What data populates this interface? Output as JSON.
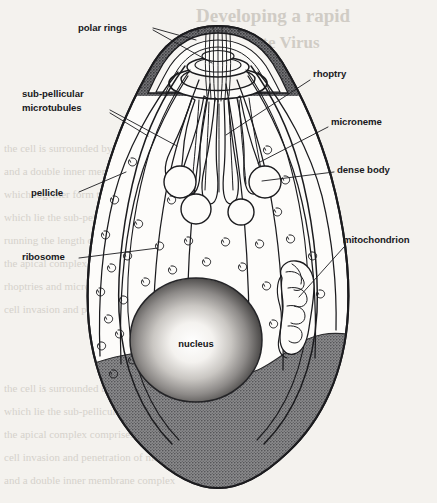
{
  "page": {
    "background_color": "#f4f2ee",
    "ink_color": "#1b1b1e",
    "width": 437,
    "height": 503
  },
  "figure": {
    "organism_shape": "pear-shaped / teardrop cell with apical complex at top",
    "fill_colors": {
      "cytoplasm": "#fdfcfa",
      "apical_cap_shading": "#6e6e70",
      "posterior_shading": "#7e7e80",
      "nucleus_rim": "#2a2a2c",
      "nucleus_core": "#fbfaf8"
    }
  },
  "labels": [
    {
      "id": "polar-rings",
      "text": "polar rings",
      "x": 78,
      "y": 31,
      "anchor": "start"
    },
    {
      "id": "sub-pellicular",
      "text": "sub-pellicular",
      "x": 22,
      "y": 97,
      "anchor": "start"
    },
    {
      "id": "microtubules",
      "text": "microtubules",
      "x": 22,
      "y": 111,
      "anchor": "start"
    },
    {
      "id": "pellicle",
      "text": "pellicle",
      "x": 31,
      "y": 196,
      "anchor": "start"
    },
    {
      "id": "ribosome",
      "text": "ribosome",
      "x": 22,
      "y": 260,
      "anchor": "start"
    },
    {
      "id": "rhoptry",
      "text": "rhoptry",
      "x": 313,
      "y": 77,
      "anchor": "start"
    },
    {
      "id": "microneme",
      "text": "microneme",
      "x": 331,
      "y": 125,
      "anchor": "start"
    },
    {
      "id": "dense-body",
      "text": "dense body",
      "x": 337,
      "y": 173,
      "anchor": "start"
    },
    {
      "id": "mitochondrion",
      "text": "mitochondrion",
      "x": 343,
      "y": 243,
      "anchor": "start"
    },
    {
      "id": "nucleus",
      "text": "nucleus",
      "x": 196,
      "y": 347,
      "anchor": "middle"
    }
  ],
  "bleed_through": {
    "note": "faint mirrored text showing through from the reverse page",
    "title_line_1": "Developing a rapid",
    "title_line_2": "Candidate Virus",
    "body_lines": [
      "the cell is surrounded by a plasma membrane",
      "and a double inner membrane complex",
      "which together form the pellicle, beneath",
      "which lie the sub-pellicular microtubules",
      "running the length of the organism",
      "the apical complex comprises polar rings",
      "rhoptries and micronemes involved in host",
      "cell invasion and penetration of membranes"
    ]
  },
  "organelles": [
    {
      "name": "polar rings",
      "count": 2,
      "location": "apical tip"
    },
    {
      "name": "conoid/apical cap",
      "count": 1,
      "location": "apical tip"
    },
    {
      "name": "rhoptry",
      "count": 5,
      "location": "anterior third"
    },
    {
      "name": "microneme",
      "count": 6,
      "location": "anterior third"
    },
    {
      "name": "dense body",
      "count": 5,
      "location": "mid anterior"
    },
    {
      "name": "ribosome",
      "count": 34,
      "location": "cytoplasm"
    },
    {
      "name": "mitochondrion",
      "count": 1,
      "location": "right posterior"
    },
    {
      "name": "nucleus",
      "count": 1,
      "location": "posterior centre"
    },
    {
      "name": "sub-pellicular microtubules",
      "count": 11,
      "location": "along pellicle"
    }
  ]
}
